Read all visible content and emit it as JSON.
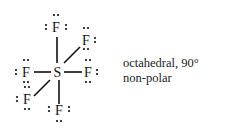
{
  "molecule": {
    "central_atom": "S",
    "ligand_atom": "F",
    "lone_pair_glyph": "••",
    "bond_color": "#111111"
  },
  "caption": {
    "geometry": "octahedral, 90°",
    "polarity": "non-polar"
  }
}
